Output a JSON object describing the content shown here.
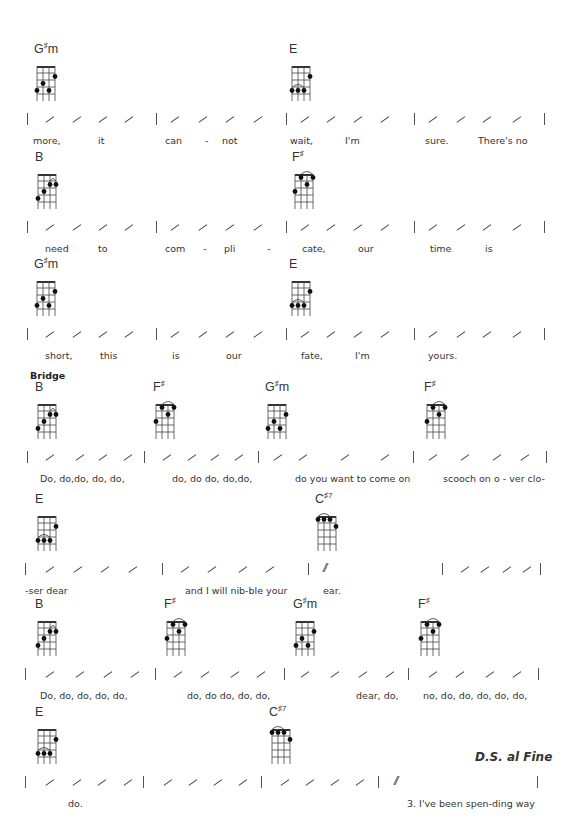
{
  "systems": [
    {
      "top": 42,
      "chords": [
        {
          "name": "G",
          "acc": "♯",
          "suffix": "m",
          "x": 34,
          "shape": "Gsm"
        },
        {
          "name": "E",
          "acc": "",
          "suffix": "",
          "x": 289,
          "shape": "E"
        }
      ],
      "bars": [
        27,
        156,
        286,
        414,
        544
      ],
      "slashes": [
        [
          45,
          72,
          98,
          124
        ],
        [
          170,
          198,
          225,
          253
        ],
        [
          300,
          326,
          353,
          380
        ],
        [
          428,
          456,
          482,
          512
        ]
      ],
      "lyrics": [
        {
          "text": "more,",
          "x": 33
        },
        {
          "text": "it",
          "x": 98
        },
        {
          "text": "can",
          "x": 165
        },
        {
          "text": "-",
          "x": 205
        },
        {
          "text": "not",
          "x": 222
        },
        {
          "text": "wait,",
          "x": 290
        },
        {
          "text": "I'm",
          "x": 345
        },
        {
          "text": "sure.",
          "x": 425
        },
        {
          "text": "There's no",
          "x": 478
        }
      ]
    },
    {
      "top": 150,
      "chords": [
        {
          "name": "B",
          "acc": "",
          "suffix": "",
          "x": 35,
          "shape": "B"
        },
        {
          "name": "F",
          "acc": "♯",
          "suffix": "",
          "x": 292,
          "shape": "Fs"
        }
      ],
      "bars": [
        27,
        156,
        286,
        414,
        544
      ],
      "slashes": [
        [
          45,
          72,
          98,
          124
        ],
        [
          170,
          198,
          225,
          253
        ],
        [
          300,
          326,
          353,
          380
        ],
        [
          428,
          456,
          482,
          512
        ]
      ],
      "lyrics": [
        {
          "text": "need",
          "x": 45
        },
        {
          "text": "to",
          "x": 98
        },
        {
          "text": "com",
          "x": 165
        },
        {
          "text": "-",
          "x": 203
        },
        {
          "text": "pli",
          "x": 224
        },
        {
          "text": "-",
          "x": 267
        },
        {
          "text": "cate,",
          "x": 302
        },
        {
          "text": "our",
          "x": 358
        },
        {
          "text": "time",
          "x": 430
        },
        {
          "text": "is",
          "x": 485
        }
      ]
    },
    {
      "top": 257,
      "chords": [
        {
          "name": "G",
          "acc": "♯",
          "suffix": "m",
          "x": 34,
          "shape": "Gsm"
        },
        {
          "name": "E",
          "acc": "",
          "suffix": "",
          "x": 289,
          "shape": "E"
        }
      ],
      "bars": [
        27,
        156,
        286,
        414,
        544
      ],
      "slashes": [
        [
          45,
          72,
          98,
          124
        ],
        [
          170,
          198,
          225,
          253
        ],
        [
          300,
          326,
          353,
          380
        ],
        [
          428,
          456,
          482,
          512
        ]
      ],
      "lyrics": [
        {
          "text": "short,",
          "x": 45
        },
        {
          "text": "this",
          "x": 100
        },
        {
          "text": "is",
          "x": 172
        },
        {
          "text": "our",
          "x": 226
        },
        {
          "text": "fate,",
          "x": 301
        },
        {
          "text": "I'm",
          "x": 355
        },
        {
          "text": "yours.",
          "x": 428
        }
      ],
      "section": {
        "text": "Bridge",
        "x": 30,
        "y": 113
      }
    },
    {
      "top": 380,
      "chords": [
        {
          "name": "B",
          "acc": "",
          "suffix": "",
          "x": 35,
          "shape": "B"
        },
        {
          "name": "F",
          "acc": "♯",
          "suffix": "",
          "x": 153,
          "shape": "Fs"
        },
        {
          "name": "G",
          "acc": "♯",
          "suffix": "m",
          "x": 265,
          "shape": "Gsm"
        },
        {
          "name": "F",
          "acc": "♯",
          "suffix": "",
          "x": 424,
          "shape": "Fs"
        }
      ],
      "bars": [
        27,
        144,
        258,
        413,
        546
      ],
      "slashes": [
        [
          45,
          75,
          98,
          123
        ],
        [
          162,
          187,
          210,
          234
        ],
        [
          273,
          298,
          340,
          380
        ],
        [
          428,
          460,
          492,
          520
        ]
      ],
      "lyrics": [
        {
          "text": "Do, do,do,   do,   do,",
          "x": 40
        },
        {
          "text": "do,  do do,  do,do,",
          "x": 172
        },
        {
          "text": "do you want to come on",
          "x": 295
        },
        {
          "text": "scooch on o - ver clo-",
          "x": 443
        }
      ]
    },
    {
      "top": 492,
      "chords": [
        {
          "name": "E",
          "acc": "",
          "suffix": "",
          "x": 35,
          "shape": "E"
        },
        {
          "name": "C",
          "acc": "♯",
          "suffix": "7",
          "x": 315,
          "shape": "Cs7"
        }
      ],
      "bars": [
        25,
        162,
        308,
        442,
        540
      ],
      "slashes": [
        [
          45,
          73,
          100,
          128
        ],
        [
          180,
          207,
          238,
          265
        ],
        [],
        [
          460,
          480,
          502,
          522
        ]
      ],
      "repeat": {
        "x": 323
      },
      "lyrics": [
        {
          "text": "-ser  dear",
          "x": 25
        },
        {
          "text": "and  I  will nib-ble  your",
          "x": 185
        },
        {
          "text": "ear.",
          "x": 323
        }
      ]
    },
    {
      "top": 597,
      "chords": [
        {
          "name": "B",
          "acc": "",
          "suffix": "",
          "x": 35,
          "shape": "B"
        },
        {
          "name": "F",
          "acc": "♯",
          "suffix": "",
          "x": 164,
          "shape": "Fs"
        },
        {
          "name": "G",
          "acc": "♯",
          "suffix": "m",
          "x": 293,
          "shape": "Gsm"
        },
        {
          "name": "F",
          "acc": "♯",
          "suffix": "",
          "x": 418,
          "shape": "Fs"
        }
      ],
      "bars": [
        25,
        155,
        284,
        408,
        538
      ],
      "slashes": [
        [
          45,
          75,
          103,
          130
        ],
        [
          173,
          200,
          230,
          256
        ],
        [
          300,
          330,
          358,
          385
        ],
        [
          428,
          455,
          485,
          512
        ]
      ],
      "lyrics": [
        {
          "text": "Do, do, do,    do,    do,",
          "x": 40
        },
        {
          "text": "do,   do do, do,    do,",
          "x": 187
        },
        {
          "text": "dear,    do,",
          "x": 356
        },
        {
          "text": "no, do,   do, do, do,    do,",
          "x": 423
        }
      ]
    },
    {
      "top": 705,
      "chords": [
        {
          "name": "E",
          "acc": "",
          "suffix": "",
          "x": 35,
          "shape": "E"
        },
        {
          "name": "C",
          "acc": "♯",
          "suffix": "7",
          "x": 269,
          "shape": "Cs7"
        }
      ],
      "bars": [
        25,
        143,
        261,
        378,
        537
      ],
      "slashes": [
        [
          45,
          72,
          97,
          123
        ],
        [
          163,
          188,
          213,
          238
        ],
        [
          280,
          305,
          330,
          355
        ],
        []
      ],
      "repeat": {
        "x": 394
      },
      "lyrics": [
        {
          "text": "do.",
          "x": 68
        },
        {
          "text": "3.  I've been spen-ding way",
          "x": 407
        }
      ],
      "ds": {
        "text": "D.S. al Fine",
        "x": 475,
        "y": 45
      }
    }
  ],
  "shapes": {
    "Gsm": {
      "dots": [
        [
          0,
          4
        ],
        [
          1,
          3
        ],
        [
          2,
          4
        ],
        [
          3,
          2
        ]
      ],
      "tie": null
    },
    "E": {
      "dots": [
        [
          0,
          4
        ],
        [
          1,
          4
        ],
        [
          2,
          4
        ],
        [
          3,
          2
        ]
      ],
      "tie": [
        0,
        2,
        4
      ]
    },
    "B": {
      "dots": [
        [
          0,
          4
        ],
        [
          1,
          3
        ],
        [
          2,
          2
        ],
        [
          3,
          2
        ]
      ],
      "tie": [
        2,
        3,
        2
      ]
    },
    "Fs": {
      "dots": [
        [
          0,
          3
        ],
        [
          1,
          1
        ],
        [
          2,
          2
        ],
        [
          3,
          1
        ]
      ],
      "tie": [
        1,
        3,
        1
      ]
    },
    "Cs7": {
      "dots": [
        [
          0,
          1
        ],
        [
          1,
          1
        ],
        [
          2,
          1
        ],
        [
          3,
          2
        ]
      ],
      "tie": [
        0,
        2,
        1
      ]
    }
  }
}
